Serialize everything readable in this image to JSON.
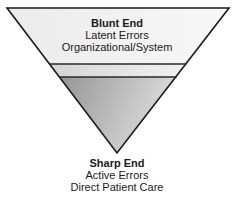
{
  "diagram": {
    "type": "inverted-triangle",
    "colors": {
      "outline": "#1a1a1a",
      "top_band": "#f3f3f3",
      "middle_band": "#e6e6e6",
      "bottom_gradient_start": "#9a9a9a",
      "bottom_gradient_end": "#dcdcdc"
    },
    "top": {
      "title": "Blunt End",
      "line1": "Latent Errors",
      "line2": "Organizational/System"
    },
    "bottom": {
      "title": "Sharp End",
      "line1": "Active Errors",
      "line2": "Direct Patient Care"
    }
  }
}
